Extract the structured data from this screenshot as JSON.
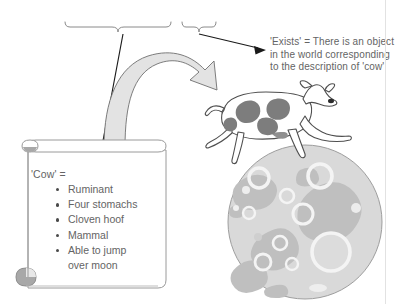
{
  "figure": {
    "width": 395,
    "height": 304,
    "background_color": "#ffffff"
  },
  "annotations": {
    "brace_left_covers": "A moon-jumping cow",
    "brace_right_covers": "exists",
    "exists_gloss": "'Exists' = There is an object\nin the world corresponding\nto the description of 'cow'",
    "cow_definition_label": "'Cow' =",
    "cow_definition_items": [
      "Ruminant",
      "Four stomachs",
      "Cloven hoof",
      "Mammal",
      "Able to jump\nover moon"
    ]
  },
  "icons": {
    "scroll": "scroll-icon",
    "cow": "jumping-cow-icon",
    "moon": "moon-icon",
    "thick_arrow": "thick-curved-arrow-icon",
    "thin_arrow_to_scroll": "thin-arrow-icon",
    "thin_arrow_to_gloss": "thin-arrow-icon",
    "brace_left": "curly-brace-icon",
    "brace_right": "curly-brace-icon"
  },
  "colors": {
    "text": "#646464",
    "outline": "#555555",
    "thick_arrow_fill": "#e2e2e2",
    "moon_base": "#d8d8d8",
    "moon_mare": "#bdbdbd",
    "moon_crater_light": "#f0f0f0",
    "cow_spot": "#8c8c8c",
    "scroll_curl": "#a8a8a8",
    "border": "#e2e2e2"
  }
}
